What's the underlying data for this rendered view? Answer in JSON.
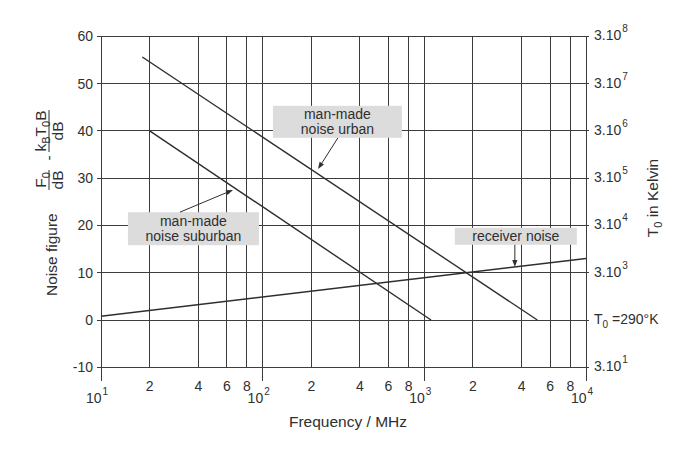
{
  "chart_data": {
    "type": "line",
    "title": "",
    "xlabel": "Frequency / MHz",
    "xscale": "log",
    "xlim": [
      10,
      10000
    ],
    "ylim": [
      -10,
      60
    ],
    "grid": true,
    "legend": "none (inline annotations)",
    "ylabel_text": "Noise figure F0/dB - kB T0 B/dB",
    "ylabel": {
      "text": "Noise figure",
      "fraction1": {
        "num": [
          {
            "t": "F"
          },
          {
            "t": "0",
            "sub": true
          }
        ],
        "den": "dB"
      },
      "operator": "-",
      "fraction2": {
        "num": [
          {
            "t": "k"
          },
          {
            "t": "B",
            "sub": true
          },
          {
            "t": "T"
          },
          {
            "t": "0",
            "sub": true
          },
          {
            "t": "B"
          }
        ],
        "den": "dB"
      }
    },
    "y_ticks": [
      -10,
      0,
      10,
      20,
      30,
      40,
      50,
      60
    ],
    "x_decade_ticks": [
      {
        "value": 10,
        "base": "10",
        "exp": "1"
      },
      {
        "value": 100,
        "base": "10",
        "exp": "2"
      },
      {
        "value": 1000,
        "base": "10",
        "exp": "3"
      },
      {
        "value": 10000,
        "base": "10",
        "exp": "4"
      }
    ],
    "x_minor_ticks": [
      {
        "value": 20,
        "label": "2"
      },
      {
        "value": 40,
        "label": "4"
      },
      {
        "value": 60,
        "label": "6"
      },
      {
        "value": 80,
        "label": "8"
      },
      {
        "value": 200,
        "label": "2"
      },
      {
        "value": 400,
        "label": "4"
      },
      {
        "value": 600,
        "label": "6"
      },
      {
        "value": 800,
        "label": "8"
      },
      {
        "value": 2000,
        "label": "2"
      },
      {
        "value": 4000,
        "label": "4"
      },
      {
        "value": 6000,
        "label": "6"
      },
      {
        "value": 8000,
        "label": "8"
      }
    ],
    "right_axis": {
      "label": "T0 in Kelvin",
      "label_runs": [
        {
          "t": "T"
        },
        {
          "t": "0",
          "sub": true
        },
        {
          "t": " in Kelvin"
        }
      ],
      "ticks": [
        {
          "y": 60,
          "text": "3.10^8",
          "runs": [
            {
              "t": "3.10"
            },
            {
              "t": "8",
              "sup": true
            }
          ]
        },
        {
          "y": 50,
          "text": "3.10^7",
          "runs": [
            {
              "t": "3.10"
            },
            {
              "t": "7",
              "sup": true
            }
          ]
        },
        {
          "y": 40,
          "text": "3.10^6",
          "runs": [
            {
              "t": "3.10"
            },
            {
              "t": "6",
              "sup": true
            }
          ]
        },
        {
          "y": 30,
          "text": "3.10^5",
          "runs": [
            {
              "t": "3.10"
            },
            {
              "t": "5",
              "sup": true
            }
          ]
        },
        {
          "y": 20,
          "text": "3.10^4",
          "runs": [
            {
              "t": "3.10"
            },
            {
              "t": "4",
              "sup": true
            }
          ]
        },
        {
          "y": 10,
          "text": "3.10^3",
          "runs": [
            {
              "t": "3.10"
            },
            {
              "t": "3",
              "sup": true
            }
          ]
        },
        {
          "y": 0,
          "text": "T0 =290°K",
          "runs": [
            {
              "t": "T"
            },
            {
              "t": "0",
              "sub": true
            },
            {
              "t": " =290°K"
            }
          ]
        },
        {
          "y": -10,
          "text": "3.10^1",
          "runs": [
            {
              "t": "3.10"
            },
            {
              "t": "1",
              "sup": true
            }
          ]
        }
      ]
    },
    "series": [
      {
        "name": "man-made noise urban",
        "points": [
          [
            18,
            55.6
          ],
          [
            5000,
            0
          ]
        ]
      },
      {
        "name": "man-made noise suburban",
        "points": [
          [
            20,
            40
          ],
          [
            1100,
            0
          ]
        ]
      },
      {
        "name": "receiver noise",
        "points": [
          [
            10,
            0.8
          ],
          [
            10000,
            13
          ]
        ]
      }
    ],
    "annotations": [
      {
        "id": "urban",
        "lines": [
          "man-made",
          "noise urban"
        ],
        "box_center": [
          290,
          41.9
        ],
        "box_size": [
          129,
          32
        ],
        "arrow_from": [
          292,
          38.5
        ],
        "arrow_to": [
          220,
          31.9
        ]
      },
      {
        "id": "suburban",
        "lines": [
          "man-made",
          "noise suburban"
        ],
        "box_center": [
          37.3,
          19.3
        ],
        "box_size": [
          131,
          33
        ],
        "arrow_from": [
          30.8,
          22.8
        ],
        "arrow_to": [
          65.5,
          27.5
        ]
      },
      {
        "id": "receiver",
        "lines": [
          "receiver noise"
        ],
        "box_center": [
          3680,
          17.7
        ],
        "box_size": [
          122,
          17
        ],
        "arrow_from": [
          3630,
          15.9
        ],
        "arrow_to": [
          3630,
          11.2
        ]
      }
    ]
  }
}
